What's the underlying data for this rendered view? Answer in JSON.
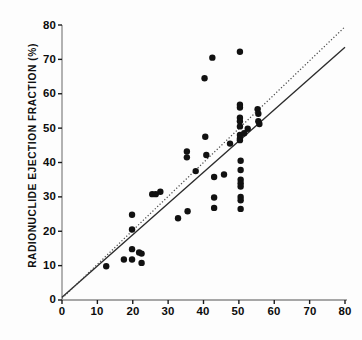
{
  "chart_data": {
    "type": "scatter",
    "title": "",
    "xlabel": "",
    "ylabel": "RADIONUCLIDE EJECTION FRACTION (%)",
    "xlim": [
      0,
      80
    ],
    "ylim": [
      0,
      80
    ],
    "xticks": [
      0,
      10,
      20,
      30,
      40,
      50,
      60,
      70,
      80
    ],
    "yticks": [
      0,
      10,
      20,
      30,
      40,
      50,
      60,
      70,
      80
    ],
    "xtick_labels": [
      "0",
      "10",
      "20",
      "30",
      "40",
      "50",
      "60",
      "70",
      "80"
    ],
    "ytick_labels": [
      "0",
      "10",
      "20",
      "30",
      "40",
      "50",
      "60",
      "70",
      "80"
    ],
    "grid": false,
    "legend": "none",
    "marker": "filled-circle",
    "marker_color": "#111111",
    "marker_size": 3.2,
    "series": [
      {
        "name": "patients",
        "points": [
          [
            12.5,
            9.8
          ],
          [
            17.5,
            11.8
          ],
          [
            19.8,
            24.8
          ],
          [
            19.8,
            20.5
          ],
          [
            19.8,
            14.8
          ],
          [
            19.8,
            11.8
          ],
          [
            21.8,
            13.8
          ],
          [
            22.5,
            13.5
          ],
          [
            22.5,
            10.8
          ],
          [
            25.5,
            30.8
          ],
          [
            26.5,
            30.8
          ],
          [
            27.8,
            31.5
          ],
          [
            32.8,
            23.8
          ],
          [
            35.3,
            43.2
          ],
          [
            35.3,
            41.5
          ],
          [
            35.5,
            25.8
          ],
          [
            37.8,
            37.5
          ],
          [
            40.3,
            64.5
          ],
          [
            40.5,
            47.5
          ],
          [
            40.8,
            42.2
          ],
          [
            42.5,
            70.5
          ],
          [
            43.0,
            35.8
          ],
          [
            43.0,
            29.8
          ],
          [
            43.0,
            26.8
          ],
          [
            45.8,
            36.5
          ],
          [
            47.5,
            45.5
          ],
          [
            50.3,
            72.2
          ],
          [
            50.3,
            56.8
          ],
          [
            50.3,
            56.0
          ],
          [
            50.3,
            53.0
          ],
          [
            50.3,
            52.0
          ],
          [
            50.3,
            50.5
          ],
          [
            50.3,
            48.0
          ],
          [
            50.3,
            47.0
          ],
          [
            50.3,
            46.5
          ],
          [
            50.5,
            40.5
          ],
          [
            50.5,
            37.8
          ],
          [
            50.5,
            35.0
          ],
          [
            50.5,
            34.0
          ],
          [
            50.5,
            33.0
          ],
          [
            50.5,
            30.0
          ],
          [
            50.5,
            29.0
          ],
          [
            50.5,
            26.5
          ],
          [
            51.5,
            48.5
          ],
          [
            52.5,
            49.8
          ],
          [
            55.3,
            55.5
          ],
          [
            55.5,
            54.2
          ],
          [
            55.5,
            52.0
          ],
          [
            55.8,
            51.2
          ]
        ]
      }
    ],
    "lines": [
      {
        "name": "regression-line",
        "style": "solid",
        "color": "#2b2b2b",
        "x0": 0,
        "y0": 0.8,
        "x1": 80,
        "y1": 73.5
      },
      {
        "name": "identity-line",
        "style": "dotted",
        "color": "#4a4a4a",
        "x0": 0,
        "y0": 0.5,
        "x1": 80,
        "y1": 79.5
      }
    ]
  },
  "caption": {
    "text": ""
  }
}
